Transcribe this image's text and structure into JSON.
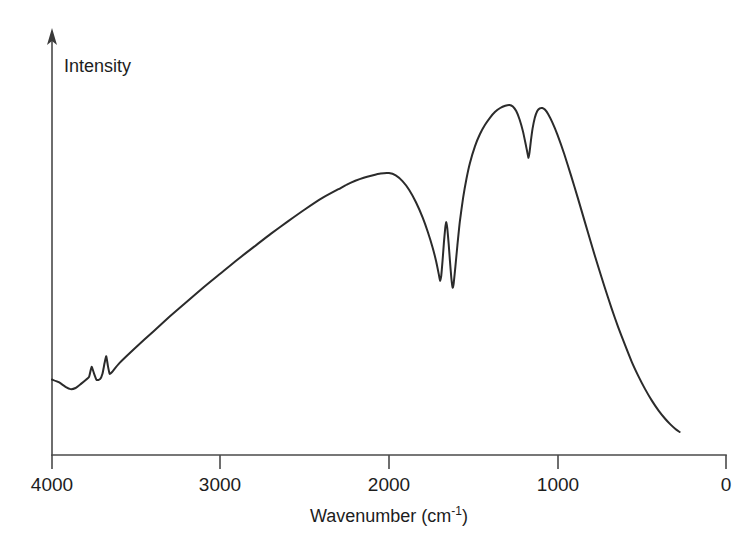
{
  "chart_data": {
    "type": "line",
    "title": "",
    "xlabel": "Wavenumber (cm",
    "xlabel_sup": "-1",
    "xlabel_tail": ")",
    "xlabel_full": "Wavenumber (cm⁻¹)",
    "ylabel": "Intensity",
    "xlim": [
      4000,
      0
    ],
    "ylim": [
      0,
      1
    ],
    "x_reversed": true,
    "grid": false,
    "legend": null,
    "xticks": [
      {
        "value": 4000,
        "label": "4000"
      },
      {
        "value": 3000,
        "label": "3000"
      },
      {
        "value": 2000,
        "label": "2000"
      },
      {
        "value": 1000,
        "label": "1000"
      },
      {
        "value": 0,
        "label": "0"
      }
    ],
    "yticks": [],
    "series": [
      {
        "name": "IR transmission spectrum",
        "color": "#2b2b2b",
        "points": [
          [
            4000,
            0.197
          ],
          [
            3960,
            0.19
          ],
          [
            3920,
            0.178
          ],
          [
            3890,
            0.172
          ],
          [
            3860,
            0.175
          ],
          [
            3830,
            0.185
          ],
          [
            3800,
            0.196
          ],
          [
            3780,
            0.204
          ],
          [
            3765,
            0.23
          ],
          [
            3750,
            0.212
          ],
          [
            3735,
            0.196
          ],
          [
            3715,
            0.198
          ],
          [
            3700,
            0.213
          ],
          [
            3688,
            0.24
          ],
          [
            3678,
            0.258
          ],
          [
            3668,
            0.232
          ],
          [
            3658,
            0.212
          ],
          [
            3645,
            0.216
          ],
          [
            3600,
            0.24
          ],
          [
            3500,
            0.282
          ],
          [
            3400,
            0.322
          ],
          [
            3300,
            0.362
          ],
          [
            3200,
            0.4
          ],
          [
            3100,
            0.438
          ],
          [
            3000,
            0.474
          ],
          [
            2900,
            0.51
          ],
          [
            2800,
            0.544
          ],
          [
            2700,
            0.578
          ],
          [
            2600,
            0.61
          ],
          [
            2500,
            0.641
          ],
          [
            2400,
            0.67
          ],
          [
            2300,
            0.694
          ],
          [
            2250,
            0.706
          ],
          [
            2200,
            0.716
          ],
          [
            2150,
            0.724
          ],
          [
            2100,
            0.73
          ],
          [
            2050,
            0.735
          ],
          [
            2000,
            0.736
          ],
          [
            1960,
            0.73
          ],
          [
            1920,
            0.715
          ],
          [
            1880,
            0.692
          ],
          [
            1840,
            0.66
          ],
          [
            1800,
            0.62
          ],
          [
            1770,
            0.583
          ],
          [
            1740,
            0.54
          ],
          [
            1720,
            0.505
          ],
          [
            1705,
            0.473
          ],
          [
            1697,
            0.455
          ],
          [
            1690,
            0.468
          ],
          [
            1682,
            0.508
          ],
          [
            1674,
            0.555
          ],
          [
            1666,
            0.594
          ],
          [
            1660,
            0.608
          ],
          [
            1654,
            0.592
          ],
          [
            1646,
            0.552
          ],
          [
            1638,
            0.505
          ],
          [
            1630,
            0.462
          ],
          [
            1622,
            0.437
          ],
          [
            1616,
            0.448
          ],
          [
            1606,
            0.492
          ],
          [
            1594,
            0.548
          ],
          [
            1580,
            0.608
          ],
          [
            1560,
            0.672
          ],
          [
            1540,
            0.722
          ],
          [
            1520,
            0.762
          ],
          [
            1490,
            0.806
          ],
          [
            1460,
            0.838
          ],
          [
            1430,
            0.862
          ],
          [
            1400,
            0.881
          ],
          [
            1370,
            0.896
          ],
          [
            1340,
            0.906
          ],
          [
            1310,
            0.912
          ],
          [
            1285,
            0.914
          ],
          [
            1265,
            0.91
          ],
          [
            1245,
            0.898
          ],
          [
            1225,
            0.876
          ],
          [
            1205,
            0.845
          ],
          [
            1190,
            0.814
          ],
          [
            1178,
            0.788
          ],
          [
            1172,
            0.776
          ],
          [
            1166,
            0.79
          ],
          [
            1158,
            0.82
          ],
          [
            1148,
            0.852
          ],
          [
            1135,
            0.88
          ],
          [
            1120,
            0.898
          ],
          [
            1105,
            0.905
          ],
          [
            1090,
            0.906
          ],
          [
            1075,
            0.902
          ],
          [
            1055,
            0.89
          ],
          [
            1030,
            0.868
          ],
          [
            1000,
            0.836
          ],
          [
            960,
            0.786
          ],
          [
            920,
            0.73
          ],
          [
            880,
            0.672
          ],
          [
            840,
            0.612
          ],
          [
            800,
            0.552
          ],
          [
            760,
            0.494
          ],
          [
            720,
            0.438
          ],
          [
            680,
            0.384
          ],
          [
            640,
            0.334
          ],
          [
            600,
            0.288
          ],
          [
            560,
            0.244
          ],
          [
            520,
            0.206
          ],
          [
            480,
            0.172
          ],
          [
            440,
            0.142
          ],
          [
            400,
            0.116
          ],
          [
            360,
            0.094
          ],
          [
            330,
            0.08
          ],
          [
            300,
            0.068
          ],
          [
            275,
            0.06
          ]
        ]
      }
    ]
  },
  "axes": {
    "x_axis_name": "wavenumber-axis",
    "y_axis_name": "intensity-axis",
    "y_axis_arrow": "up-arrow"
  }
}
